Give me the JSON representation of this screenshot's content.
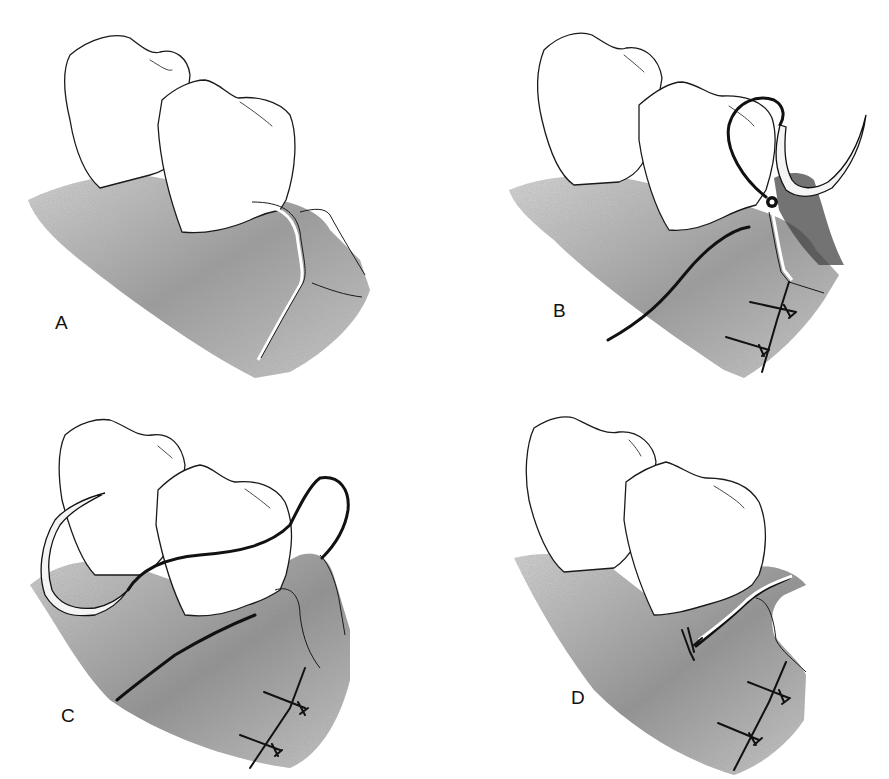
{
  "figure": {
    "panels": [
      {
        "id": "a",
        "label": "A",
        "description": "Two teeth with flap incision in gingiva, interdental papilla separated"
      },
      {
        "id": "b",
        "label": "B",
        "description": "Suture needle passed through flap; loop around tooth; two interrupted sutures below"
      },
      {
        "id": "c",
        "label": "C",
        "description": "Suture thread wrapped around lingual of tooth, needle returning; two interrupted sutures below"
      },
      {
        "id": "d",
        "label": "D",
        "description": "Sling suture tied near papilla; flap closed with two interrupted sutures"
      }
    ]
  },
  "colors": {
    "background": "#ffffff",
    "line": "#111111",
    "gum_light": "#c8c8c8",
    "gum_dark": "#6e6e6e",
    "tooth": "#ffffff"
  }
}
